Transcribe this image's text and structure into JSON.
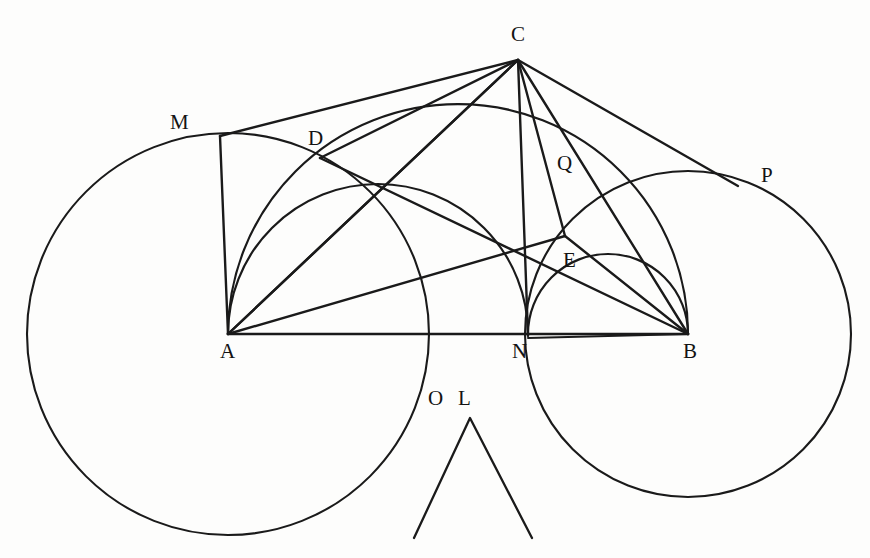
{
  "figure": {
    "kind": "euclidean-geometry-diagram",
    "caption": "",
    "background_color": "#fdfdfc",
    "ink_color": "#1a1a1a",
    "width": 870,
    "height": 558,
    "points": [
      {
        "id": "M",
        "label": "M",
        "x": 220,
        "y": 136,
        "label_x": 170,
        "label_y": 112
      },
      {
        "id": "C",
        "label": "C",
        "x": 518,
        "y": 60,
        "label_x": 511,
        "label_y": 24
      },
      {
        "id": "D",
        "label": "D",
        "x": 320,
        "y": 158,
        "label_x": 308,
        "label_y": 128
      },
      {
        "id": "Q",
        "label": "Q",
        "x": 566,
        "y": 180,
        "label_x": 557,
        "label_y": 153
      },
      {
        "id": "P",
        "label": "P",
        "x": 738,
        "y": 186,
        "label_x": 761,
        "label_y": 165
      },
      {
        "id": "E",
        "label": "E",
        "x": 565,
        "y": 236,
        "label_x": 563,
        "label_y": 250
      },
      {
        "id": "A",
        "label": "A",
        "x": 228,
        "y": 334,
        "label_x": 220,
        "label_y": 341
      },
      {
        "id": "N",
        "label": "N",
        "x": 528,
        "y": 334,
        "label_x": 512,
        "label_y": 341
      },
      {
        "id": "B",
        "label": "B",
        "x": 688,
        "y": 334,
        "label_x": 683,
        "label_y": 341
      },
      {
        "id": "O",
        "label": "O",
        "x": 437,
        "y": 405,
        "label_x": 428,
        "label_y": 388
      },
      {
        "id": "L",
        "label": "L",
        "x": 468,
        "y": 405,
        "label_x": 458,
        "label_y": 388
      }
    ],
    "circles": [
      {
        "id": "circle-A",
        "center_x": 228,
        "center_y": 334,
        "radius": 201
      },
      {
        "id": "circle-B",
        "center_x": 688,
        "center_y": 334,
        "radius": 163
      }
    ],
    "arcs": [
      {
        "id": "semicircle-AB",
        "from": "A",
        "to": "B",
        "center_x": 458,
        "center_y": 334,
        "radius": 230
      },
      {
        "id": "semicircle-AN",
        "from": "A",
        "to": "N",
        "center_x": 378,
        "center_y": 334,
        "radius": 150
      },
      {
        "id": "semicircle-NB",
        "from": "N",
        "to": "B",
        "center_x": 608,
        "center_y": 334,
        "radius": 80
      }
    ],
    "segments": [
      {
        "id": "segment-AB",
        "from": "A",
        "to": "B"
      },
      {
        "id": "segment-AC",
        "from": "A",
        "to": "C"
      },
      {
        "id": "segment-AD",
        "from": "A",
        "to": "D"
      },
      {
        "id": "segment-AM",
        "from": "A",
        "to": "M"
      },
      {
        "id": "segment-AE",
        "from": "A",
        "to": "E"
      },
      {
        "id": "segment-CM",
        "from": "C",
        "to": "M"
      },
      {
        "id": "segment-CD",
        "from": "C",
        "to": "D"
      },
      {
        "id": "segment-CN",
        "from": "C",
        "to": "N"
      },
      {
        "id": "segment-CE",
        "from": "C",
        "to": "E"
      },
      {
        "id": "segment-CB",
        "from": "C",
        "to": "B"
      },
      {
        "id": "segment-CP",
        "from": "C",
        "to": "P"
      },
      {
        "id": "segment-DB",
        "from": "D",
        "to": "B"
      },
      {
        "id": "segment-EB",
        "from": "E",
        "to": "B"
      },
      {
        "id": "segment-NB",
        "from": "N",
        "to": "B"
      }
    ],
    "chevron": {
      "id": "angle-mark-OL",
      "apex_x": 470,
      "apex_y": 418,
      "left_x": 414,
      "left_y": 538,
      "right_x": 532,
      "right_y": 538
    }
  }
}
